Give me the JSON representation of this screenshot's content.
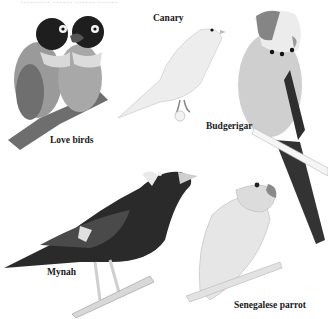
{
  "page": {
    "top_text_cropped": "………   ……   ……  ……"
  },
  "birds": [
    {
      "name": "Love birds",
      "label_pos": [
        50,
        136
      ]
    },
    {
      "name": "Canary",
      "label_pos": [
        153,
        14
      ]
    },
    {
      "name": "Budgerigar",
      "label_pos": [
        206,
        122
      ]
    },
    {
      "name": "Mynah",
      "label_pos": [
        47,
        268
      ]
    },
    {
      "name": "Senegalese parrot",
      "label_pos": [
        234,
        301
      ]
    }
  ],
  "colors": {
    "background": "#ffffff",
    "label": "#1a1a1a",
    "dark_plumage": "#2a2a2a",
    "mid_gray": "#8a8a8a",
    "light_gray": "#d8d8d8",
    "pale": "#ececec"
  }
}
